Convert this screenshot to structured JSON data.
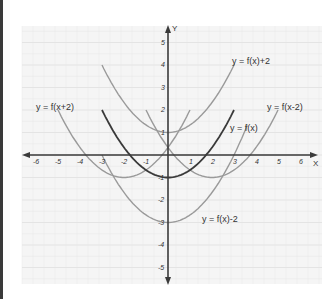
{
  "chart_data": {
    "type": "line",
    "title": "",
    "xlabel": "X",
    "ylabel": "Y",
    "xlim": [
      -6.5,
      6.5
    ],
    "ylim": [
      -5.5,
      5.5
    ],
    "grid": true,
    "x_ticks": [
      "-6",
      "-5",
      "-4",
      "-3",
      "-2",
      "-1",
      "1",
      "2",
      "3",
      "4",
      "5",
      "6"
    ],
    "y_ticks": [
      "5",
      "4",
      "3",
      "2",
      "1",
      "-1",
      "-2",
      "-3",
      "-4",
      "-5"
    ],
    "series": [
      {
        "name": "y = f(x)",
        "formula": "x^2/3 - 1",
        "x_range": [
          -3,
          3
        ],
        "color": "#3a3a3a",
        "vertex": [
          0,
          -1
        ]
      },
      {
        "name": "y = f(x)+2",
        "formula": "x^2/3 + 1",
        "x_range": [
          -3,
          3.6
        ],
        "color": "#9a9a9a",
        "vertex": [
          0,
          1
        ]
      },
      {
        "name": "y = f(x)-2",
        "formula": "x^2/3 - 3",
        "x_range": [
          -3,
          3.6
        ],
        "color": "#9a9a9a",
        "vertex": [
          0,
          -3
        ]
      },
      {
        "name": "y = f(x+2)",
        "formula": "(x+2)^2/3 - 1",
        "x_range": [
          -5,
          1
        ],
        "color": "#9a9a9a",
        "vertex": [
          -2,
          -1
        ]
      },
      {
        "name": "y = f(x-2)",
        "formula": "(x-2)^2/3 - 1",
        "x_range": [
          -1,
          5
        ],
        "color": "#9a9a9a",
        "vertex": [
          2,
          -1
        ]
      }
    ],
    "annotations": [
      {
        "text": "y = f(x+2)",
        "x": -5.5,
        "y": 2.4
      },
      {
        "text": "y = f(x)+2",
        "x": 2.9,
        "y": 4.5
      },
      {
        "text": "y = f(x-2)",
        "x": 4.5,
        "y": 2.0
      },
      {
        "text": "y = f(x)",
        "x": 2.8,
        "y": 1.2
      },
      {
        "text": "y = f(x)-2",
        "x": 1.6,
        "y": -2.6
      }
    ]
  },
  "labels": {
    "x_axis": "X",
    "y_axis": "Y",
    "curve_fx": "y = f(x)",
    "curve_fx_plus2": "y = f(x)+2",
    "curve_fx_minus2": "y = f(x)-2",
    "curve_fxplus2": "y = f(x+2)",
    "curve_fxminus2": "y = f(x-2)",
    "xt_m6": "-6",
    "xt_m5": "-5",
    "xt_m4": "-4",
    "xt_m3": "-3",
    "xt_m2": "-2",
    "xt_m1": "-1",
    "xt_1": "1",
    "xt_2": "2",
    "xt_3": "3",
    "xt_4": "4",
    "xt_5": "5",
    "xt_6": "6",
    "yt_5": "5",
    "yt_4": "4",
    "yt_3": "3",
    "yt_2": "2",
    "yt_1": "1",
    "yt_m1": "-1",
    "yt_m2": "-2",
    "yt_m3": "-3",
    "yt_m4": "-4",
    "yt_m5": "-5"
  },
  "colors": {
    "axis": "#3a3a3a",
    "primary_curve": "#3a3a3a",
    "transformed_curve": "#9a9a9a",
    "grid": "#e2e2e2",
    "plot_bg": "#f5f5f5"
  }
}
